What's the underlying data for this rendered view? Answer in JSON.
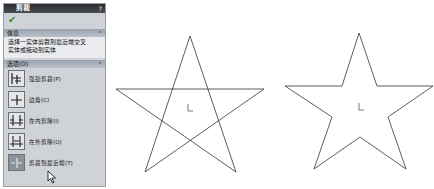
{
  "panel": {
    "title": "剪裁",
    "help": "?",
    "ok_icon": "checkmark-icon",
    "message_section": {
      "label": "信息",
      "collapse": "^"
    },
    "message": [
      "选择一实体剪裁到最近端交叉",
      "实体或拖动到实体"
    ],
    "options_section": {
      "label": "选项(O)",
      "collapse": "^"
    },
    "options": [
      {
        "label": "强劲剪裁(P)",
        "icon": "power-trim-icon",
        "selected": false
      },
      {
        "label": "边角(C)",
        "icon": "corner-trim-icon",
        "selected": false
      },
      {
        "label": "在内剪除(I)",
        "icon": "trim-away-inside-icon",
        "selected": false
      },
      {
        "label": "在外剪除(O)",
        "icon": "trim-away-outside-icon",
        "selected": false
      },
      {
        "label": "剪裁到最近端(T)",
        "icon": "trim-to-closest-icon",
        "selected": true
      }
    ]
  },
  "canvas": {
    "left_figure": "pentagram-before-trim",
    "right_figure": "star-outline-after-trim"
  }
}
